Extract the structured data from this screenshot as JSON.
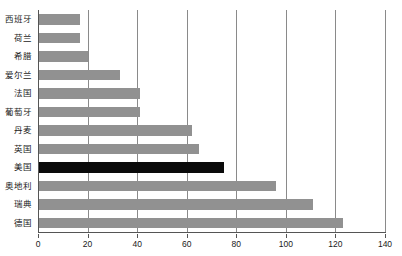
{
  "chart_data": {
    "type": "bar",
    "orientation": "horizontal",
    "title": "",
    "subtitle": "",
    "xlabel": "",
    "ylabel": "",
    "xlim": [
      0,
      140
    ],
    "ylim": null,
    "grid": true,
    "legend": null,
    "legend_position": "none",
    "xticks": [
      0,
      20,
      40,
      60,
      80,
      100,
      120,
      140
    ],
    "categories": [
      "西班牙",
      "荷兰",
      "希腊",
      "爱尔兰",
      "法国",
      "葡萄牙",
      "丹麦",
      "英国",
      "美国",
      "奥地利",
      "瑞典",
      "德国"
    ],
    "values": [
      17,
      17,
      20,
      33,
      41,
      41,
      62,
      65,
      75,
      96,
      111,
      123
    ],
    "colors": [
      "#919191",
      "#919191",
      "#919191",
      "#919191",
      "#919191",
      "#919191",
      "#919191",
      "#919191",
      "#0a0a0a",
      "#919191",
      "#919191",
      "#919191"
    ],
    "highlight_category": "美国",
    "bar_color": "#919191",
    "highlight_color": "#0a0a0a",
    "grid_color": "#8a8a8a",
    "axis_color": "#555555",
    "background": "#ffffff"
  }
}
